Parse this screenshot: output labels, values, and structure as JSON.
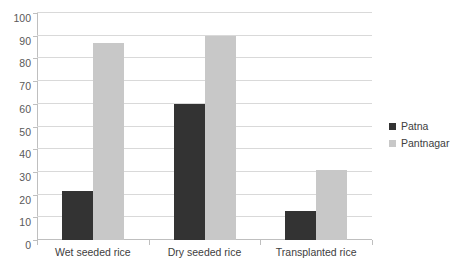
{
  "chart_data": {
    "type": "bar",
    "title": "",
    "subtitle": "",
    "xlabel": "",
    "ylabel": "",
    "categories": [
      "Wet seeded rice",
      "Dry seeded rice",
      "Transplanted rice"
    ],
    "series": [
      {
        "name": "Patna",
        "color": "#333333",
        "values": [
          21.5,
          60,
          13
        ]
      },
      {
        "name": "Pantnagar",
        "color": "#c8c8c8",
        "values": [
          87,
          90,
          31
        ]
      }
    ],
    "ylim": [
      0,
      100
    ],
    "ytick_step": 10,
    "yticks": [
      0,
      10,
      20,
      30,
      40,
      50,
      60,
      70,
      80,
      90,
      100
    ],
    "ytick_labels": [
      "0",
      "10",
      "20",
      "30",
      "40",
      "50",
      "60",
      "70",
      "80",
      "90",
      "100"
    ],
    "grid": true,
    "grid_axis": "y",
    "legend_position": "right",
    "grouping": "clustered"
  },
  "legend": {
    "entries": [
      {
        "label": "Patna",
        "color": "#333333"
      },
      {
        "label": "Pantnagar",
        "color": "#c8c8c8"
      }
    ]
  },
  "colors": {
    "patna": "#333333",
    "pantnagar": "#c8c8c8",
    "gridline": "#d9d9d9",
    "axis": "#bfbfbf",
    "tick_text": "#595959",
    "category_text": "#404040",
    "background": "#ffffff"
  }
}
